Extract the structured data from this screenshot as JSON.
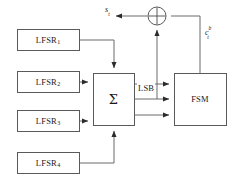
{
  "figure": {
    "type": "block-diagram",
    "width": 236,
    "height": 190,
    "background_color": "#ffffff",
    "line_color": "#4a4a4a",
    "text_color": "#1a1a1a"
  },
  "blocks": {
    "lfsr1": {
      "name": "LFSR",
      "subscript": "1",
      "x": 17,
      "y": 29,
      "w": 62,
      "h": 21
    },
    "lfsr2": {
      "name": "LFSR",
      "subscript": "2",
      "x": 17,
      "y": 71,
      "w": 62,
      "h": 21
    },
    "lfsr3": {
      "name": "LFSR",
      "subscript": "3",
      "x": 17,
      "y": 110,
      "w": 62,
      "h": 21
    },
    "lfsr4": {
      "name": "LFSR",
      "subscript": "4",
      "x": 17,
      "y": 152,
      "w": 62,
      "h": 21
    },
    "summer": {
      "name": "Σ",
      "x": 93,
      "y": 73,
      "w": 41,
      "h": 52
    },
    "fsm": {
      "name": "FSM",
      "x": 174,
      "y": 73,
      "w": 52,
      "h": 52
    }
  },
  "gates": {
    "xor": {
      "name": "⊕",
      "symbol": "xor-circle",
      "cx": 157,
      "cy": 16,
      "r": 9
    }
  },
  "signals": {
    "output": {
      "base": "s",
      "subscript": "t",
      "label": "s_t",
      "x": 106,
      "y": 7
    },
    "fsm_feedback": {
      "base": "c",
      "subscript": "t",
      "superscript": "b",
      "label": "c_t^b",
      "x": 207,
      "y": 27
    },
    "lsb": {
      "label": "LSB",
      "x": 140,
      "y": 88
    }
  },
  "connections": [
    {
      "from": "lfsr1",
      "to": "summer",
      "port": "top",
      "style": "right-then-down"
    },
    {
      "from": "lfsr2",
      "to": "summer",
      "port": "left-upper",
      "style": "straight"
    },
    {
      "from": "lfsr3",
      "to": "summer",
      "port": "left-lower",
      "style": "straight"
    },
    {
      "from": "lfsr4",
      "to": "summer",
      "port": "bottom",
      "style": "right-then-up"
    },
    {
      "from": "summer",
      "to": "fsm",
      "port": "in-1",
      "style": "straight"
    },
    {
      "from": "summer",
      "to": "fsm",
      "port": "in-2",
      "style": "straight"
    },
    {
      "from": "summer",
      "to": "fsm",
      "port": "in-3",
      "style": "straight"
    },
    {
      "from": "summer-lsb",
      "to": "xor",
      "port": "bottom",
      "style": "up"
    },
    {
      "from": "fsm",
      "to": "xor",
      "port": "right",
      "style": "up-then-left"
    },
    {
      "from": "xor",
      "to": "output",
      "port": "left",
      "style": "left"
    }
  ]
}
